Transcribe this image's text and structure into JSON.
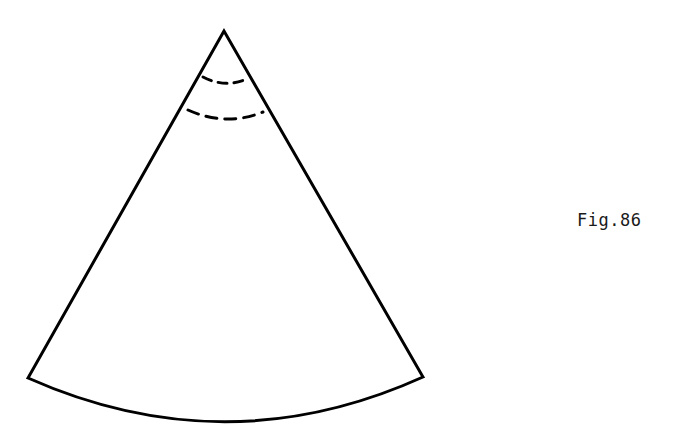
{
  "figure": {
    "label": "Fig.86",
    "background_color": "#ffffff",
    "stroke_color": "#000000",
    "stroke_width": 3,
    "canvas": {
      "width": 693,
      "height": 436
    },
    "shape_name": "circular-sector-cone-development",
    "apex": {
      "x": 224,
      "y": 31
    },
    "bottom_left_corner": {
      "x": 28,
      "y": 378
    },
    "bottom_right_corner": {
      "x": 423,
      "y": 377
    },
    "bottom_arc": {
      "name": "outer-arc",
      "style": "solid",
      "start": {
        "x": 28,
        "y": 378
      },
      "control": {
        "x": 226,
        "y": 466
      },
      "end": {
        "x": 423,
        "y": 377
      },
      "lowest_point": {
        "x": 226,
        "y": 422
      }
    },
    "dashed_arcs": [
      {
        "name": "upper-dashed-arc",
        "style": "dashed",
        "dash_pattern": "9 7",
        "start": {
          "x": 203,
          "y": 77
        },
        "control": {
          "x": 226,
          "y": 89
        },
        "end": {
          "x": 249,
          "y": 78
        }
      },
      {
        "name": "lower-dashed-arc",
        "style": "dashed",
        "dash_pattern": "11 8",
        "start": {
          "x": 188,
          "y": 110
        },
        "control": {
          "x": 226,
          "y": 127
        },
        "end": {
          "x": 263,
          "y": 112
        }
      }
    ],
    "radii": [
      {
        "name": "left-radius",
        "from": {
          "x": 224,
          "y": 31
        },
        "to": {
          "x": 28,
          "y": 378
        }
      },
      {
        "name": "right-radius",
        "from": {
          "x": 224,
          "y": 31
        },
        "to": {
          "x": 423,
          "y": 377
        }
      }
    ]
  }
}
